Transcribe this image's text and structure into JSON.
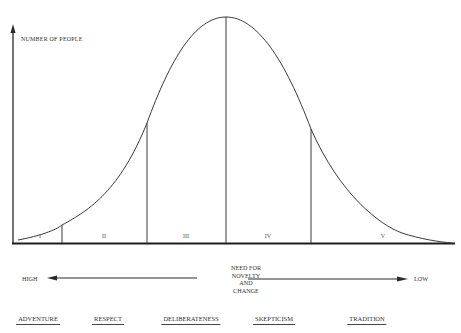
{
  "diagram": {
    "y_axis_label": "NUMBER OF PEOPLE",
    "segments": [
      {
        "label": "I",
        "x_center": 40
      },
      {
        "label": "II",
        "x_center": 104
      },
      {
        "label": "III",
        "x_center": 186
      },
      {
        "label": "IV",
        "x_center": 268
      },
      {
        "label": "V",
        "x_center": 383
      }
    ],
    "axis": {
      "center_label": [
        "NEED FOR",
        "NOVELTY",
        "AND",
        "CHANGE"
      ],
      "left_end": "HIGH",
      "right_end": "LOW"
    },
    "traits": [
      {
        "label": "ADVENTURE",
        "x_center": 38
      },
      {
        "label": "RESPECT",
        "x_center": 108
      },
      {
        "label": "DELIBERATENESS",
        "x_center": 191
      },
      {
        "label": "SKEPTICISM",
        "x_center": 274
      },
      {
        "label": "TRADITION",
        "x_center": 367
      }
    ],
    "colors": {
      "line": "#3a3a3a",
      "background": "#ffffff"
    }
  }
}
